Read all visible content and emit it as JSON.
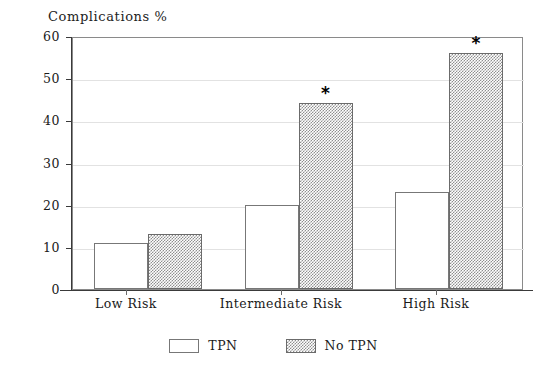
{
  "chart_data": {
    "type": "bar",
    "title": "Complications %",
    "xlabel": "",
    "ylabel": "Complications %",
    "ylim": [
      0,
      60
    ],
    "yticks": [
      0,
      10,
      20,
      30,
      40,
      50,
      60
    ],
    "grid": true,
    "legend_position": "bottom-center",
    "categories": [
      "Low Risk",
      "Intermediate Risk",
      "High Risk"
    ],
    "series": [
      {
        "name": "TPN",
        "style": "hollow",
        "values": [
          11,
          20,
          23
        ]
      },
      {
        "name": "No TPN",
        "style": "hatched",
        "values": [
          13,
          44,
          56
        ]
      }
    ],
    "annotations": [
      {
        "label": "*",
        "category": "Intermediate Risk",
        "series": "No TPN",
        "value": 44
      },
      {
        "label": "*",
        "category": "High Risk",
        "series": "No TPN",
        "value": 56
      }
    ]
  },
  "axis": {
    "y_tick_labels": [
      "60",
      "50",
      "40",
      "30",
      "20",
      "10",
      "0"
    ],
    "x_tick_labels": [
      "Low Risk",
      "Intermediate Risk",
      "High Risk"
    ]
  },
  "legend": {
    "items": [
      {
        "label": "TPN",
        "swatch": "hollow-swatch"
      },
      {
        "label": "No TPN",
        "swatch": "hatched-swatch"
      }
    ]
  },
  "colors": {
    "frame": "#8a8a8a",
    "axis": "#3a3a3a",
    "grid": "#e2e2e2",
    "hatch": "#8f8f8f",
    "bar_outline": "#777777",
    "background": "#ffffff"
  }
}
